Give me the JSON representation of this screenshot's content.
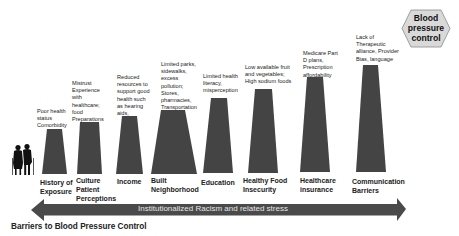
{
  "goal": {
    "label": "Blood\npressure\ncontrol",
    "fill": "#d9d9d9",
    "stroke": "#888888"
  },
  "barriers": [
    {
      "label": "History of\nExposure",
      "description": "Poor health\nstatus\nComorbidity"
    },
    {
      "label": "Culture\nPatient\nPerceptions",
      "description": "Mistrust\nExperience\nwith\nhealthcare;\nfood\nPreparations"
    },
    {
      "label": "Income",
      "description": "Reduced\nresources to\nsupport good\nhealth such\nas hearing\naids,"
    },
    {
      "label": "Built\nNeighborhood",
      "description": "Limited parks,\nsidewalks,\nexcess\npollution;\nStores,\npharmacies,\nTransportation"
    },
    {
      "label": "Education",
      "description": "Limited health\nliteracy,\nmisperception"
    },
    {
      "label": "Healthy Food\nInsecurity",
      "description": "Low available fruit\nand vegetables;\nHigh sodium foods"
    },
    {
      "label": "Healthcare\ninsurance",
      "description": "Medicare  Part\nD plans,\nPrescription\naffordability"
    },
    {
      "label": "Communication\nBarriers",
      "description": "Lack of\nTherapeutic\nalliance, Provider\nBias, language"
    }
  ],
  "arrow": {
    "label": "Institutionalized Racism and related stress",
    "fill": "#4a4a4a"
  },
  "pillar_color": "#444444",
  "title": "Barriers to Blood Pressure Control",
  "icons": {
    "people": "elderly-couple-silhouette"
  }
}
